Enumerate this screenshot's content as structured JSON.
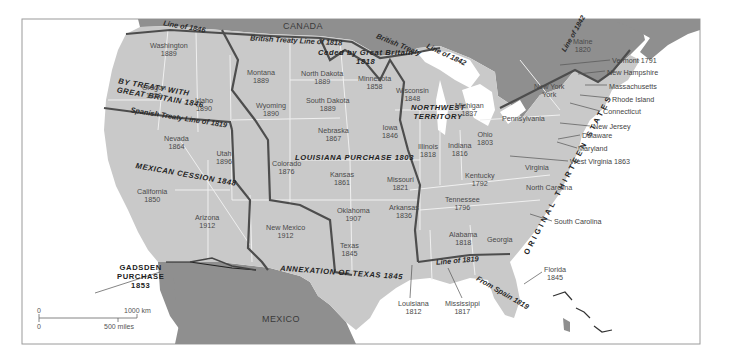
{
  "map": {
    "title_countries": {
      "canada": "CANADA",
      "mexico": "MEXICO"
    },
    "colors": {
      "us_land": "#c9c9c9",
      "foreign_land": "#8f8f8f",
      "water": "#ffffff",
      "state_border": "#f2f2f2",
      "acquisition_border": "#4d4d4d",
      "frame": "#9a9a9a"
    },
    "states": [
      {
        "name": "Washington",
        "year": "1889"
      },
      {
        "name": "Oregon",
        "year": "1859"
      },
      {
        "name": "Idaho",
        "year": "1890"
      },
      {
        "name": "Montana",
        "year": "1889"
      },
      {
        "name": "Wyoming",
        "year": "1890"
      },
      {
        "name": "North Dakota",
        "year": "1889"
      },
      {
        "name": "South Dakota",
        "year": "1889"
      },
      {
        "name": "Minnesota",
        "year": "1858"
      },
      {
        "name": "Wisconsin",
        "year": "1848"
      },
      {
        "name": "Michigan",
        "year": "1837"
      },
      {
        "name": "Nevada",
        "year": "1864"
      },
      {
        "name": "Utah",
        "year": "1896"
      },
      {
        "name": "California",
        "year": "1850"
      },
      {
        "name": "Arizona",
        "year": "1912"
      },
      {
        "name": "Colorado",
        "year": "1876"
      },
      {
        "name": "Nebraska",
        "year": "1867"
      },
      {
        "name": "Iowa",
        "year": "1846"
      },
      {
        "name": "Illinois",
        "year": "1818"
      },
      {
        "name": "Indiana",
        "year": "1816"
      },
      {
        "name": "Ohio",
        "year": "1803"
      },
      {
        "name": "Kansas",
        "year": "1861"
      },
      {
        "name": "Missouri",
        "year": "1821"
      },
      {
        "name": "Kentucky",
        "year": "1792"
      },
      {
        "name": "Tennessee",
        "year": "1796"
      },
      {
        "name": "Oklahoma",
        "year": "1907"
      },
      {
        "name": "Arkansas",
        "year": "1836"
      },
      {
        "name": "New Mexico",
        "year": "1912"
      },
      {
        "name": "Texas",
        "year": "1845"
      },
      {
        "name": "Alabama",
        "year": "1818"
      },
      {
        "name": "Georgia",
        "year": ""
      },
      {
        "name": "Pennsylvania",
        "year": ""
      },
      {
        "name": "New York",
        "year": ""
      },
      {
        "name": "Maine",
        "year": "1820"
      },
      {
        "name": "Virginia",
        "year": ""
      },
      {
        "name": "North Carolina",
        "year": ""
      }
    ],
    "callouts": [
      {
        "label": "Vermont 1791"
      },
      {
        "label": "New Hampshire"
      },
      {
        "label": "Massachusetts"
      },
      {
        "label": "Rhode Island"
      },
      {
        "label": "Connecticut"
      },
      {
        "label": "New Jersey"
      },
      {
        "label": "Delaware"
      },
      {
        "label": "Maryland"
      },
      {
        "label": "West Virginia 1863"
      },
      {
        "label": "South Carolina"
      },
      {
        "label": "Florida",
        "year": "1845"
      },
      {
        "label": "Louisiana",
        "year": "1812"
      },
      {
        "label": "Mississippi",
        "year": "1817"
      }
    ],
    "regions": {
      "oregon_treaty": [
        "BY TREATY WITH",
        "GREAT BRITAIN 1846"
      ],
      "mexican_cession": "MEXICAN CESSION 1848",
      "louisiana_purchase": "LOUISIANA PURCHASE 1803",
      "northwest_territory": [
        "NORTHWEST",
        "TERRITORY"
      ],
      "annexation_texas": "ANNEXATION OF TEXAS 1845",
      "gadsden": [
        "GADSDEN",
        "PURCHASE",
        "1853"
      ],
      "original_states": "ORIGINAL THIRTEEN STATES",
      "ceded_gb": [
        "Ceded by Great Britain",
        "1818"
      ]
    },
    "boundary_lines": {
      "line_1846": "Line of 1846",
      "british_1818": "British Treaty Line of 1818",
      "british_1842_a": "British Treaty",
      "british_1842_b": "Line of 1842",
      "line_1842_maine": "Line of 1842",
      "spanish_1819": "Spanish Treaty Line of 1819",
      "line_1819": "Line of 1819",
      "from_spain": "From Spain 1819"
    },
    "scale_bar": {
      "km_zero": "0",
      "km_label": "1000 km",
      "mi_zero": "0",
      "mi_label": "500 miles"
    }
  }
}
